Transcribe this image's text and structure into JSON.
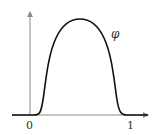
{
  "diagram": {
    "type": "function-plot",
    "function_label": "φ",
    "x_ticks": [
      {
        "value": 0,
        "label": "0"
      },
      {
        "value": 1,
        "label": "1"
      }
    ],
    "colors": {
      "axis": "#8a8a8a",
      "curve": "#111111",
      "text": "#333333"
    }
  }
}
